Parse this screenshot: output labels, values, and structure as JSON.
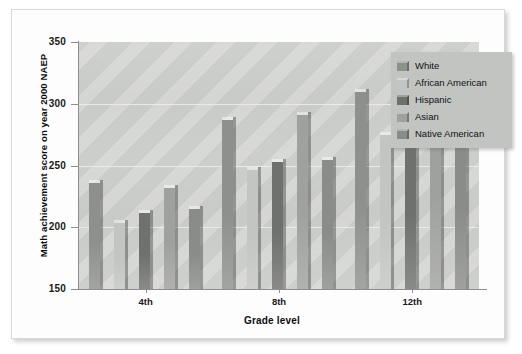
{
  "chart_data": {
    "type": "bar",
    "title": "",
    "xlabel": "Grade level",
    "ylabel": "Math achievement score on year 2000 NAEP",
    "categories": [
      "4th",
      "8th",
      "12th"
    ],
    "ylim": [
      150,
      350
    ],
    "yticks": [
      150,
      200,
      250,
      300,
      350
    ],
    "grid": true,
    "legend_position": "top-right",
    "series": [
      {
        "name": "White",
        "color": "#8e908c",
        "values": [
          238,
          289,
          312
        ]
      },
      {
        "name": "African American",
        "color": "#c3c5c2",
        "values": [
          206,
          249,
          277
        ]
      },
      {
        "name": "Hispanic",
        "color": "#6f716e",
        "values": [
          214,
          255,
          286
        ]
      },
      {
        "name": "Asian",
        "color": "#9fa19e",
        "values": [
          234,
          293,
          322
        ]
      },
      {
        "name": "Native American",
        "color": "#8a8c89",
        "values": [
          217,
          257,
          296
        ]
      }
    ]
  },
  "axis": {
    "y_tick_labels": [
      "350",
      "300",
      "250",
      "200",
      "150"
    ],
    "x_tick_labels": [
      "4th",
      "8th",
      "12th"
    ],
    "y_title": "Math achievement score on year 2000 NAEP",
    "x_title": "Grade level"
  },
  "legend": {
    "items": [
      {
        "label": "White",
        "swatch": "#8e908c"
      },
      {
        "label": "African American",
        "swatch": "#c3c5c2"
      },
      {
        "label": "Hispanic",
        "swatch": "#6f716e"
      },
      {
        "label": "Asian",
        "swatch": "#9fa19e"
      },
      {
        "label": "Native American",
        "swatch": "#8a8c89"
      }
    ]
  }
}
